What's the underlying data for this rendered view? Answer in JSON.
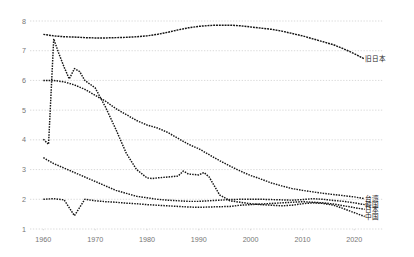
{
  "chart_data": {
    "type": "line",
    "title": "",
    "subtitle": "",
    "xlabel": "",
    "ylabel": "",
    "xlim": [
      1958,
      2024
    ],
    "ylim": [
      1,
      8
    ],
    "yticks": [
      1,
      2,
      3,
      4,
      5,
      6,
      7,
      8
    ],
    "ytick_labels": [
      "1",
      "2",
      "3",
      "4",
      "5",
      "6",
      "7",
      "8"
    ],
    "xticks": [
      1960,
      1970,
      1980,
      1990,
      2000,
      2010,
      2020
    ],
    "xtick_labels": [
      "1960",
      "1970",
      "1980",
      "1990",
      "2000",
      "2010",
      "2020"
    ],
    "grid": true,
    "grid_style": "dotted horizontal",
    "legend_position": "right-inline end-of-line labels",
    "line_style": "dotted",
    "series": [
      {
        "name": "旧日本",
        "label": "旧日本",
        "label_x": 2021,
        "label_y": 6.72,
        "x": [
          1960,
          1962,
          1964,
          1966,
          1968,
          1970,
          1972,
          1974,
          1976,
          1978,
          1980,
          1982,
          1984,
          1986,
          1988,
          1990,
          1992,
          1994,
          1996,
          1998,
          2000,
          2002,
          2004,
          2006,
          2008,
          2010,
          2012,
          2014,
          2016,
          2018,
          2020,
          2022
        ],
        "y": [
          7.55,
          7.5,
          7.47,
          7.46,
          7.44,
          7.43,
          7.43,
          7.44,
          7.45,
          7.47,
          7.5,
          7.55,
          7.62,
          7.7,
          7.77,
          7.82,
          7.85,
          7.86,
          7.86,
          7.84,
          7.8,
          7.76,
          7.72,
          7.66,
          7.58,
          7.5,
          7.4,
          7.3,
          7.2,
          7.06,
          6.9,
          6.72
        ]
      },
      {
        "name": "台湾",
        "label": "台湾",
        "label_x": 2021,
        "label_y": 2.02,
        "x": [
          1960,
          1962,
          1964,
          1966,
          1968,
          1970,
          1972,
          1974,
          1976,
          1978,
          1980,
          1982,
          1984,
          1986,
          1988,
          1990,
          1992,
          1994,
          1996,
          1998,
          2000,
          2002,
          2004,
          2006,
          2008,
          2010,
          2012,
          2014,
          2016,
          2018,
          2020,
          2022
        ],
        "y": [
          6.0,
          6.0,
          5.95,
          5.85,
          5.7,
          5.5,
          5.3,
          5.05,
          4.85,
          4.65,
          4.5,
          4.4,
          4.25,
          4.05,
          3.85,
          3.7,
          3.5,
          3.3,
          3.12,
          2.95,
          2.8,
          2.68,
          2.55,
          2.45,
          2.36,
          2.3,
          2.25,
          2.2,
          2.16,
          2.12,
          2.08,
          2.02
        ]
      },
      {
        "name": "韓国",
        "label": "韓国",
        "label_x": 2021,
        "label_y": 1.82,
        "x": [
          1960,
          1962,
          1964,
          1966,
          1968,
          1970,
          1972,
          1974,
          1976,
          1978,
          1980,
          1982,
          1984,
          1986,
          1988,
          1990,
          1992,
          1994,
          1996,
          1998,
          2000,
          2002,
          2004,
          2006,
          2008,
          2010,
          2012,
          2014,
          2016,
          2018,
          2020,
          2022
        ],
        "y": [
          3.4,
          3.2,
          3.05,
          2.9,
          2.75,
          2.6,
          2.45,
          2.3,
          2.2,
          2.1,
          2.05,
          2.0,
          1.97,
          1.95,
          1.93,
          1.93,
          1.95,
          1.97,
          1.99,
          2.0,
          2.0,
          2.0,
          1.99,
          1.98,
          1.97,
          1.99,
          2.02,
          2.0,
          1.96,
          1.93,
          1.88,
          1.82
        ]
      },
      {
        "name": "日本",
        "label": "日本",
        "label_x": 2021,
        "label_y": 1.66,
        "x": [
          1960,
          1962,
          1964,
          1966,
          1968,
          1970,
          1972,
          1974,
          1976,
          1978,
          1980,
          1982,
          1984,
          1986,
          1988,
          1990,
          1992,
          1994,
          1996,
          1998,
          2000,
          2002,
          2004,
          2006,
          2008,
          2010,
          2012,
          2014,
          2016,
          2018,
          2020,
          2022
        ],
        "y": [
          2.0,
          2.02,
          1.98,
          1.45,
          2.0,
          1.95,
          1.92,
          1.9,
          1.87,
          1.85,
          1.82,
          1.8,
          1.78,
          1.76,
          1.74,
          1.73,
          1.74,
          1.75,
          1.76,
          1.8,
          1.82,
          1.84,
          1.86,
          1.88,
          1.9,
          1.92,
          1.9,
          1.88,
          1.84,
          1.78,
          1.72,
          1.66
        ]
      },
      {
        "name": "中国",
        "label": "中国",
        "label_x": 2021,
        "label_y": 1.42,
        "x": [
          1960,
          1961,
          1962,
          1963,
          1964,
          1965,
          1966,
          1967,
          1968,
          1970,
          1972,
          1974,
          1976,
          1978,
          1980,
          1981,
          1982,
          1984,
          1986,
          1987,
          1988,
          1990,
          1991,
          1992,
          1994,
          1996,
          1998,
          2000,
          2002,
          2004,
          2006,
          2008,
          2010,
          2012,
          2014,
          2016,
          2018,
          2020,
          2022
        ],
        "y": [
          4.02,
          3.85,
          7.4,
          6.9,
          6.45,
          6.05,
          6.4,
          6.3,
          6.0,
          5.75,
          5.1,
          4.35,
          3.55,
          3.0,
          2.72,
          2.7,
          2.72,
          2.75,
          2.78,
          2.95,
          2.85,
          2.82,
          2.9,
          2.75,
          2.15,
          1.95,
          1.9,
          1.85,
          1.82,
          1.8,
          1.78,
          1.8,
          1.85,
          1.88,
          1.86,
          1.8,
          1.68,
          1.55,
          1.42
        ]
      }
    ]
  },
  "colors": {
    "series": "#141414",
    "grid": "#c8c8c8",
    "tick_text": "#767676",
    "background": "#ffffff"
  }
}
